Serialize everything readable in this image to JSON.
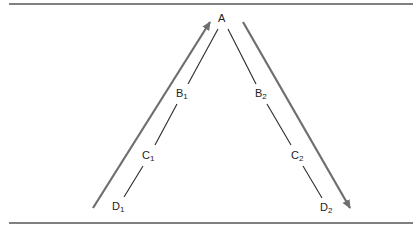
{
  "diagram": {
    "type": "inverted-V path with direction arrows",
    "colors": {
      "rule": "#808080",
      "line": "#2a2a2a",
      "arrow": "#6e6e6e",
      "text": "#222222"
    },
    "nodes": [
      {
        "id": "A",
        "base": "A",
        "sub": "",
        "x": 222,
        "y": 13
      },
      {
        "id": "B1",
        "base": "B",
        "sub": "1",
        "x": 176,
        "y": 88
      },
      {
        "id": "C1",
        "base": "C",
        "sub": "1",
        "x": 142,
        "y": 150
      },
      {
        "id": "D1",
        "base": "D",
        "sub": "1",
        "x": 112,
        "y": 201
      },
      {
        "id": "B2",
        "base": "B",
        "sub": "2",
        "x": 255,
        "y": 88
      },
      {
        "id": "C2",
        "base": "C",
        "sub": "2",
        "x": 291,
        "y": 150
      },
      {
        "id": "D2",
        "base": "D",
        "sub": "2",
        "x": 320,
        "y": 202
      }
    ],
    "edges": [
      {
        "from": "A",
        "to": "B1"
      },
      {
        "from": "B1",
        "to": "C1"
      },
      {
        "from": "C1",
        "to": "D1"
      },
      {
        "from": "A",
        "to": "B2"
      },
      {
        "from": "B2",
        "to": "C2"
      },
      {
        "from": "C2",
        "to": "D2"
      }
    ],
    "arrows": [
      {
        "name": "ascending-arrow",
        "direction": "up-right",
        "from": "D1 side",
        "to": "A side"
      },
      {
        "name": "descending-arrow",
        "direction": "down-right",
        "from": "A side",
        "to": "D2 side"
      }
    ]
  }
}
